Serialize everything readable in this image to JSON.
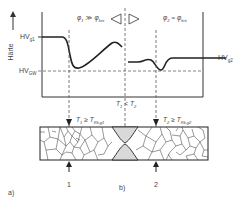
{
  "diagram": {
    "y_axis_label": "Härte",
    "levels": {
      "hv_g1": {
        "main": "HV",
        "sub": "g1"
      },
      "hv_gw": {
        "main": "HV",
        "sub": "GW"
      },
      "hv_g2": {
        "main": "HV",
        "sub": "g2"
      }
    },
    "left_condition": {
      "phi": "φ",
      "sub1": "1",
      "rel": "≫",
      "sub2": "krit"
    },
    "right_condition": {
      "phi": "φ",
      "sub1": "2",
      "rel": "≈",
      "sub2": "krit"
    },
    "temp_relation": {
      "t1": "T",
      "s1": "1",
      "rel": "<",
      "t2": "T",
      "s2": "2"
    },
    "left_temp": {
      "t": "T",
      "s": "1",
      "rel": "≥",
      "t2": "T",
      "s2": "Rk,g1"
    },
    "right_temp": {
      "t": "T",
      "s": "2",
      "rel": "≥",
      "t2": "T",
      "s2": "Rk,g2"
    },
    "markers": {
      "left": "1",
      "right": "2"
    },
    "panel_labels": {
      "a": "a)",
      "b": "b)"
    },
    "colors": {
      "line": "#222222",
      "dashed": "#555555",
      "weld_fill": "#d9d9d9",
      "grain": "#333333"
    }
  }
}
